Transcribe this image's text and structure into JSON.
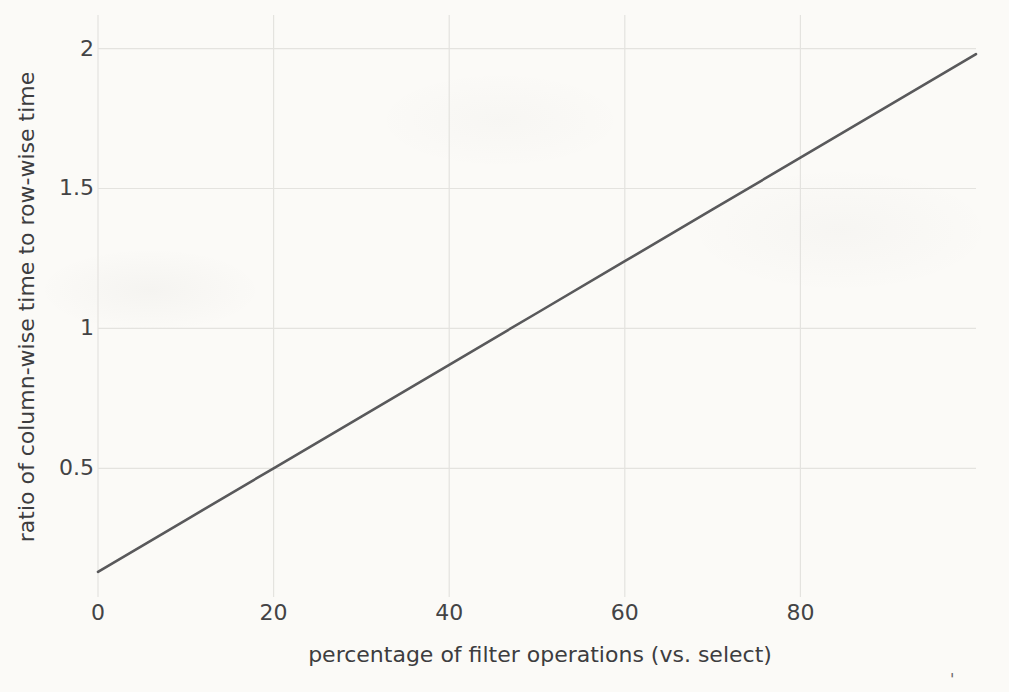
{
  "figure": {
    "background_color": "#fbfaf7",
    "text_color": "#434345",
    "grid_color": "#e4e3df",
    "scan_artifact": "'"
  },
  "chart_data": {
    "type": "line",
    "title": "",
    "xlabel": "percentage of filter operations (vs. select)",
    "ylabel": "ratio of column-wise time to row-wise time",
    "xlim": [
      0,
      100
    ],
    "ylim": [
      0.04,
      2.12
    ],
    "x_ticks": [
      0,
      20,
      40,
      60,
      80
    ],
    "x_tick_labels": [
      "0",
      "20",
      "40",
      "60",
      "80"
    ],
    "y_ticks": [
      0.5,
      1,
      1.5,
      2
    ],
    "y_tick_labels": [
      "0.5",
      "1",
      "1.5",
      "2"
    ],
    "grid": true,
    "legend": "none",
    "series": [
      {
        "name": "ratio of column-wise time to row-wise time",
        "color": "#59595b",
        "x": [
          0,
          10,
          20,
          30,
          40,
          50,
          60,
          70,
          80,
          90,
          100
        ],
        "y": [
          0.13,
          0.315,
          0.5,
          0.685,
          0.87,
          1.055,
          1.24,
          1.425,
          1.61,
          1.795,
          1.98
        ]
      }
    ]
  }
}
